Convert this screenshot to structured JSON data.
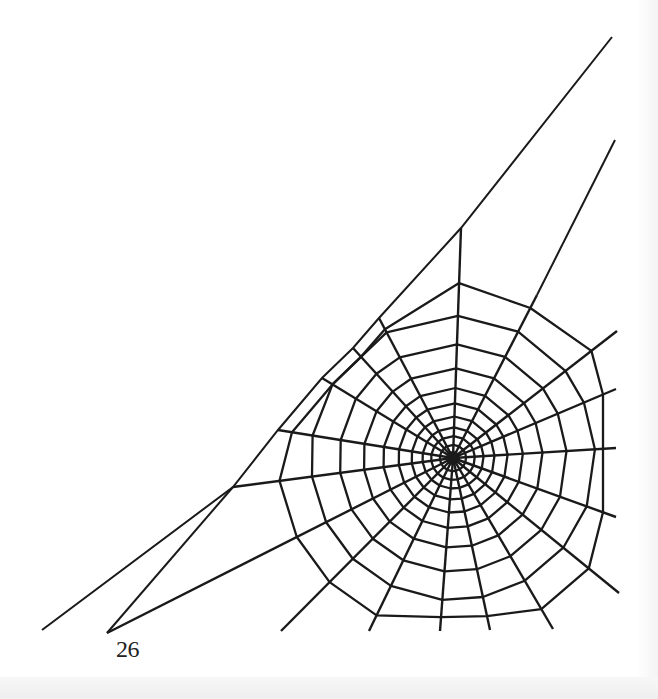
{
  "page": {
    "page_number": "26",
    "colors": {
      "ink": "#1a1a1a",
      "paper": "#ffffff"
    }
  },
  "illustration": {
    "subject": "spider-web",
    "hub": [
      453,
      458
    ],
    "frame_lines": [
      [
        [
          612,
          37
        ],
        [
          461,
          228
        ],
        [
          379,
          318
        ],
        [
          353,
          348
        ],
        [
          322,
          378
        ],
        [
          278,
          430
        ],
        [
          233,
          487
        ],
        [
          42,
          630
        ]
      ],
      [
        [
          615,
          140
        ],
        [
          537,
          295
        ]
      ],
      [
        [
          233,
          487
        ],
        [
          107,
          633
        ]
      ]
    ],
    "radial_ends": [
      [
        461,
        228
      ],
      [
        537,
        295
      ],
      [
        617,
        331
      ],
      [
        616,
        389
      ],
      [
        616,
        448
      ],
      [
        616,
        517
      ],
      [
        619,
        593
      ],
      [
        553,
        629
      ],
      [
        490,
        630
      ],
      [
        440,
        631
      ],
      [
        369,
        631
      ],
      [
        281,
        631
      ],
      [
        107,
        633
      ],
      [
        233,
        487
      ],
      [
        278,
        430
      ],
      [
        322,
        378
      ],
      [
        353,
        348
      ],
      [
        379,
        318
      ]
    ],
    "ring_fractions": [
      0.06,
      0.1,
      0.14,
      0.19,
      0.25,
      0.32,
      0.41,
      0.52,
      0.65,
      0.8
    ],
    "ring_max_radius": 175
  }
}
